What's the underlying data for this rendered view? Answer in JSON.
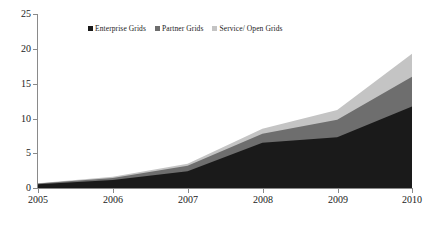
{
  "chart_data": {
    "type": "area",
    "stacked": true,
    "title": "",
    "subtitle": "",
    "xlabel": "",
    "ylabel": "",
    "categories": [
      "2005",
      "2006",
      "2007",
      "2008",
      "2009",
      "2010"
    ],
    "x": [
      2005,
      2006,
      2007,
      2008,
      2009,
      2010
    ],
    "xlim": [
      2005,
      2010
    ],
    "ylim": [
      0,
      25
    ],
    "yticks": [
      0,
      5,
      10,
      15,
      20,
      25
    ],
    "xticks": [
      "2005",
      "2006",
      "2007",
      "2008",
      "2009",
      "2010"
    ],
    "grid": false,
    "legend_position": "top-center",
    "series": [
      {
        "name": "Enterprise Grids",
        "color": "#1a1a1a",
        "values": [
          0.55,
          1.15,
          2.4,
          6.5,
          7.3,
          11.7
        ]
      },
      {
        "name": "Partner Grids",
        "color": "#6e6e6e",
        "values": [
          0.1,
          0.3,
          0.8,
          1.3,
          2.5,
          4.3
        ]
      },
      {
        "name": "Service/ Open Grids",
        "color": "#c4c4c4",
        "values": [
          0.05,
          0.15,
          0.3,
          0.7,
          1.4,
          3.3
        ]
      }
    ],
    "stack_tops": {
      "Enterprise Grids": [
        0.55,
        1.15,
        2.4,
        6.5,
        7.3,
        11.7
      ],
      "Partner Grids": [
        0.65,
        1.45,
        3.2,
        7.8,
        9.8,
        16.0
      ],
      "Service/ Open Grids": [
        0.7,
        1.6,
        3.5,
        8.5,
        11.2,
        19.3
      ]
    }
  },
  "legend": {
    "items": [
      {
        "label": "Enterprise Grids",
        "color": "#1a1a1a"
      },
      {
        "label": "Partner Grids",
        "color": "#6e6e6e"
      },
      {
        "label": "Service/ Open Grids",
        "color": "#c4c4c4"
      }
    ]
  },
  "axes": {
    "y_labels": [
      "25",
      "20",
      "15",
      "10",
      "5",
      "0"
    ],
    "x_labels": [
      "2005",
      "2006",
      "2007",
      "2008",
      "2009",
      "2010"
    ]
  }
}
